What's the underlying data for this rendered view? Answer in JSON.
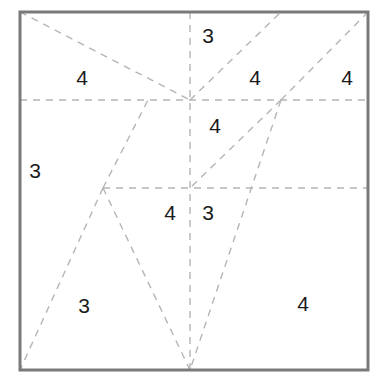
{
  "figure": {
    "width": 389,
    "height": 386,
    "background": "#ffffff",
    "border": {
      "color": "#7a7a7a",
      "width": 3,
      "x": 20,
      "y": 12,
      "w": 348,
      "h": 358
    },
    "construction_line": {
      "color": "#b5b5b5",
      "width": 1.4,
      "dash": "7,6"
    }
  },
  "vertices": {
    "top_left": {
      "x": 20,
      "y": 12
    },
    "top_right": {
      "x": 368,
      "y": 12
    },
    "bottom_left": {
      "x": 20,
      "y": 370
    },
    "bottom_right": {
      "x": 368,
      "y": 370
    },
    "center_hub": {
      "x": 190,
      "y": 100
    },
    "right_hub": {
      "x": 281,
      "y": 100
    },
    "left_notch": {
      "x": 103,
      "y": 188
    },
    "bottom_center": {
      "x": 190,
      "y": 370
    },
    "mid_upper_left": {
      "x": 148,
      "y": 100
    },
    "vertical_mid": {
      "x": 190,
      "y": 188
    }
  },
  "lines": [
    {
      "name": "horizontal-upper",
      "x1": 20,
      "y1": 100,
      "x2": 368,
      "y2": 100
    },
    {
      "name": "horizontal-lower",
      "x1": 103,
      "y1": 188,
      "x2": 368,
      "y2": 188
    },
    {
      "name": "vertical-center",
      "x1": 190,
      "y1": 12,
      "x2": 190,
      "y2": 370
    },
    {
      "name": "diagonal-topleft-to-center",
      "x1": 20,
      "y1": 12,
      "x2": 190,
      "y2": 100
    },
    {
      "name": "diagonal-center-to-topedge",
      "x1": 190,
      "y1": 100,
      "x2": 281,
      "y2": 12
    },
    {
      "name": "diagonal-righthub-to-topright",
      "x1": 281,
      "y1": 100,
      "x2": 368,
      "y2": 12
    },
    {
      "name": "diagonal-leftnotch-to-horizontal",
      "x1": 103,
      "y1": 188,
      "x2": 148,
      "y2": 100
    },
    {
      "name": "diagonal-righthub-to-verticalmid",
      "x1": 281,
      "y1": 100,
      "x2": 190,
      "y2": 188
    },
    {
      "name": "diagonal-righthub-to-bottomcenter",
      "x1": 281,
      "y1": 100,
      "x2": 190,
      "y2": 370
    },
    {
      "name": "diagonal-leftnotch-to-bottomleft",
      "x1": 103,
      "y1": 188,
      "x2": 20,
      "y2": 370
    },
    {
      "name": "diagonal-leftnotch-to-bottomcenter",
      "x1": 103,
      "y1": 188,
      "x2": 190,
      "y2": 370
    }
  ],
  "labels": [
    {
      "name": "label-3-top-center",
      "text": "3",
      "x": 208,
      "y": 35
    },
    {
      "name": "label-4-top-left",
      "text": "4",
      "x": 82,
      "y": 77
    },
    {
      "name": "label-4-top-mid-right",
      "text": "4",
      "x": 255,
      "y": 77
    },
    {
      "name": "label-4-top-far-right",
      "text": "4",
      "x": 347,
      "y": 77
    },
    {
      "name": "label-4-center",
      "text": "4",
      "x": 215,
      "y": 125
    },
    {
      "name": "label-3-left",
      "text": "3",
      "x": 35,
      "y": 170
    },
    {
      "name": "label-4-mid-lower-left",
      "text": "4",
      "x": 170,
      "y": 212
    },
    {
      "name": "label-3-mid-lower-right",
      "text": "3",
      "x": 208,
      "y": 212
    },
    {
      "name": "label-3-bottom-left",
      "text": "3",
      "x": 84,
      "y": 305
    },
    {
      "name": "label-4-bottom-right",
      "text": "4",
      "x": 303,
      "y": 303
    }
  ]
}
